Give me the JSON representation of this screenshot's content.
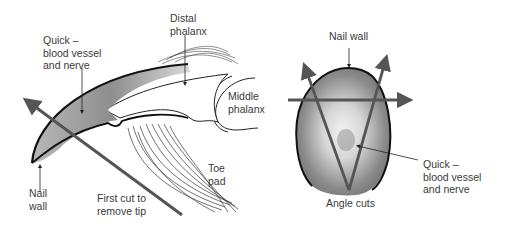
{
  "figure_left": {
    "title": "Side view of claw",
    "labels": {
      "quick": "Quick –\nblood vessel\nand nerve",
      "distal_phalanx": "Distal\nphalanx",
      "middle_phalanx": "Middle\nphalanx",
      "toe_pad": "Toe\npad",
      "nail_wall": "Nail\nwall",
      "first_cut": "First cut to\nremove tip"
    }
  },
  "figure_right": {
    "title": "Front view of claw",
    "labels": {
      "nail_wall": "Nail wall",
      "quick": "Quick –\nblood vessel\nand nerve",
      "angle_cuts": "Angle cuts"
    }
  },
  "colors": {
    "outline": "#1a1a1a",
    "cut_arrow": "#555555",
    "quick_shade": "#9a9a9a",
    "text": "#3a3a3a"
  }
}
